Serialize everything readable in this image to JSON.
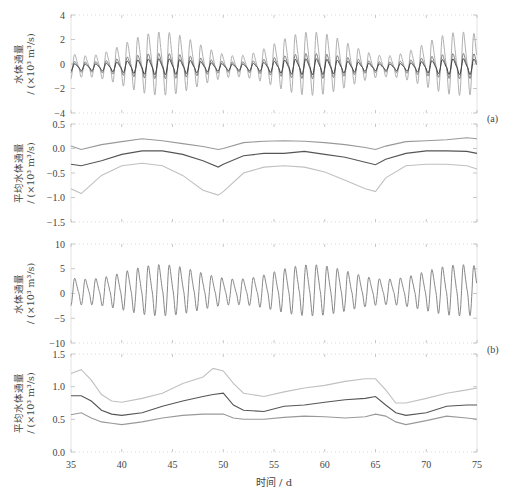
{
  "chart_data": [
    {
      "type": "line",
      "panel": "a-top",
      "ylabel": "水体通量 / (×10³ m³/s)",
      "ylim": [
        -4,
        4
      ],
      "yticks": [
        -4,
        -2,
        0,
        2,
        4
      ],
      "xlim": [
        35,
        75
      ],
      "description": "Tidal oscillation of water flux, three series (light, medium, dark); spring-neap modulation with large amplitudes near d 42-48, 58-64 and 70-75",
      "series": [
        {
          "name": "upper",
          "color": "#b0b0b0",
          "amp_range": [
            1.0,
            3.0
          ]
        },
        {
          "name": "middle",
          "color": "#808080",
          "amp_range": [
            0.8,
            2.0
          ]
        },
        {
          "name": "lower",
          "color": "#404040",
          "amp_range": [
            0.6,
            1.5
          ]
        }
      ]
    },
    {
      "type": "line",
      "panel": "a-bottom",
      "ylabel": "平均水体通量 / (×10³ m³/s)",
      "ylim": [
        -1.5,
        0.5
      ],
      "yticks": [
        -1.5,
        -1.0,
        -0.5,
        0.0,
        0.5
      ],
      "xlim": [
        35,
        75
      ],
      "x": [
        35,
        36,
        38,
        40,
        42,
        44,
        46,
        48,
        49.5,
        50,
        52,
        54,
        56,
        58,
        60,
        62,
        64,
        65,
        66,
        68,
        70,
        72,
        74,
        75
      ],
      "series": [
        {
          "name": "upper",
          "color": "#999999",
          "values": [
            0.05,
            -0.02,
            0.08,
            0.14,
            0.2,
            0.16,
            0.1,
            0.04,
            -0.02,
            0.0,
            0.12,
            0.15,
            0.16,
            0.15,
            0.12,
            0.08,
            0.02,
            -0.02,
            0.05,
            0.14,
            0.16,
            0.18,
            0.22,
            0.2
          ]
        },
        {
          "name": "mean",
          "color": "#555555",
          "values": [
            -0.32,
            -0.35,
            -0.25,
            -0.12,
            -0.05,
            -0.05,
            -0.12,
            -0.25,
            -0.38,
            -0.32,
            -0.15,
            -0.1,
            -0.1,
            -0.06,
            -0.12,
            -0.18,
            -0.28,
            -0.33,
            -0.22,
            -0.1,
            -0.05,
            -0.05,
            -0.06,
            -0.1
          ]
        },
        {
          "name": "lower",
          "color": "#c0c0c0",
          "values": [
            -0.82,
            -0.92,
            -0.55,
            -0.35,
            -0.3,
            -0.35,
            -0.55,
            -0.85,
            -0.95,
            -0.88,
            -0.5,
            -0.38,
            -0.35,
            -0.38,
            -0.48,
            -0.65,
            -0.82,
            -0.88,
            -0.6,
            -0.35,
            -0.32,
            -0.32,
            -0.35,
            -0.42
          ]
        }
      ]
    },
    {
      "type": "line",
      "panel": "b-top",
      "ylabel": "水体通量 / (×10³ m³/s)",
      "ylim": [
        -10,
        10
      ],
      "yticks": [
        -10,
        -5,
        0,
        5,
        10
      ],
      "xlim": [
        35,
        75
      ],
      "description": "Tidal oscillation with spring-neap modulation; amplitude ~3-6.5",
      "series": [
        {
          "name": "flux",
          "color": "#888888",
          "amp_range": [
            3.0,
            6.0
          ]
        }
      ]
    },
    {
      "type": "line",
      "panel": "b-bottom",
      "ylabel": "平均水体通量 / (×10³ m³/s)",
      "ylim": [
        0.0,
        1.5
      ],
      "yticks": [
        0.0,
        0.5,
        1.0,
        1.5
      ],
      "xlim": [
        35,
        75
      ],
      "x": [
        35,
        36,
        37,
        38,
        39,
        40,
        42,
        44,
        46,
        48,
        49,
        50,
        51,
        52,
        54,
        56,
        58,
        60,
        62,
        64,
        65,
        66,
        67,
        68,
        70,
        72,
        74,
        75
      ],
      "series": [
        {
          "name": "upper",
          "color": "#c0c0c0",
          "values": [
            1.2,
            1.26,
            1.1,
            0.88,
            0.78,
            0.76,
            0.82,
            0.9,
            1.05,
            1.15,
            1.28,
            1.24,
            1.05,
            0.9,
            0.85,
            0.92,
            0.98,
            1.02,
            1.08,
            1.12,
            1.12,
            0.95,
            0.75,
            0.75,
            0.82,
            0.9,
            0.95,
            0.98
          ]
        },
        {
          "name": "mean",
          "color": "#555555",
          "values": [
            0.86,
            0.86,
            0.78,
            0.64,
            0.58,
            0.56,
            0.6,
            0.7,
            0.78,
            0.85,
            0.88,
            0.9,
            0.72,
            0.64,
            0.62,
            0.7,
            0.72,
            0.76,
            0.8,
            0.82,
            0.85,
            0.72,
            0.6,
            0.56,
            0.6,
            0.7,
            0.72,
            0.72
          ]
        },
        {
          "name": "lower",
          "color": "#999999",
          "values": [
            0.57,
            0.6,
            0.52,
            0.46,
            0.44,
            0.42,
            0.46,
            0.52,
            0.56,
            0.58,
            0.58,
            0.58,
            0.52,
            0.5,
            0.5,
            0.53,
            0.55,
            0.54,
            0.52,
            0.54,
            0.58,
            0.55,
            0.46,
            0.42,
            0.48,
            0.55,
            0.52,
            0.5
          ]
        }
      ]
    }
  ],
  "xaxis": {
    "label": "时间 / d",
    "ticks": [
      35,
      40,
      45,
      50,
      55,
      60,
      65,
      70,
      75
    ]
  },
  "labels": {
    "panel_a": "(a)",
    "panel_b": "(b)",
    "flux_label_line1": "水体通量",
    "flux_label_line2": "/ (×10³ m³/s)",
    "mean_flux_label_line1": "平均水体通量",
    "mean_flux_label_line2": "/ (×10³ m³/s)"
  }
}
